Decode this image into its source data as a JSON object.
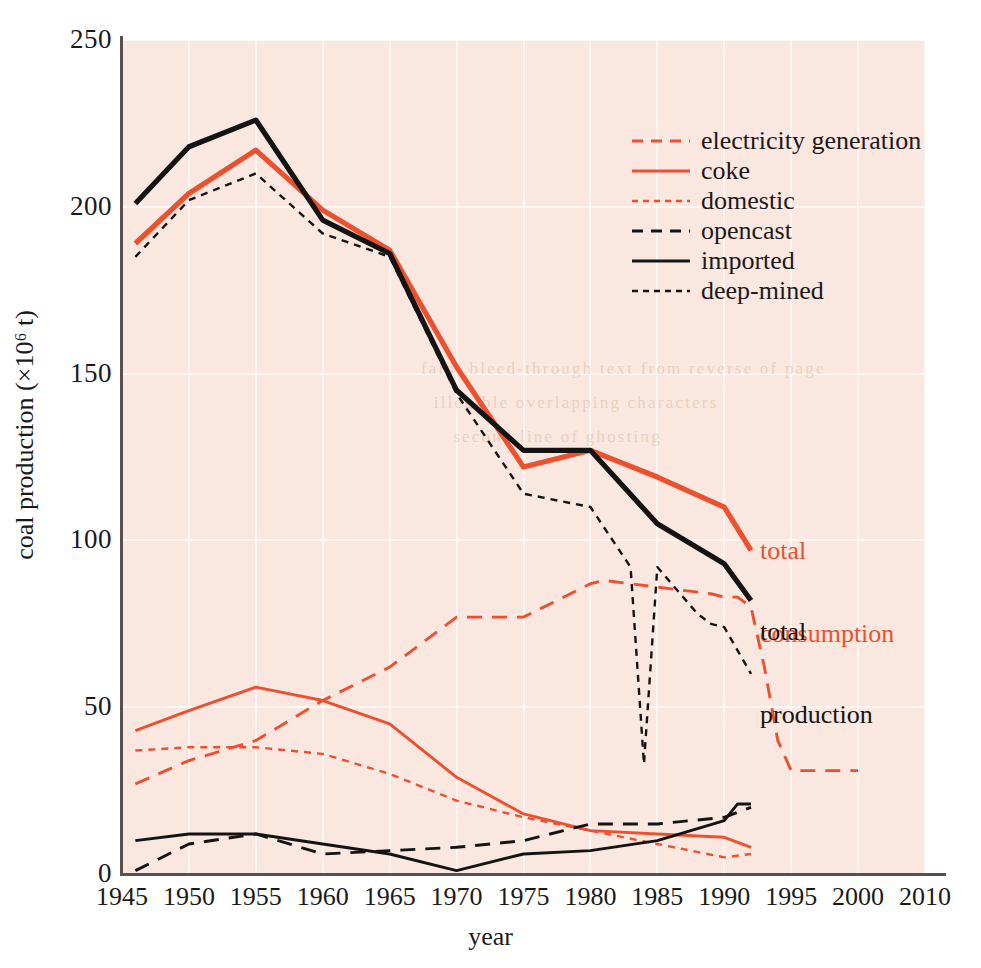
{
  "chart_data": {
    "type": "line",
    "title": "",
    "xlabel": "year",
    "ylabel": "coal production (×10⁶ t)",
    "xlim": [
      1945,
      2010
    ],
    "ylim": [
      0,
      250
    ],
    "xticks": [
      "1945",
      "1950",
      "1955",
      "1960",
      "1965",
      "1970",
      "1975",
      "1980",
      "1985",
      "1990",
      "1995",
      "2000",
      "2010"
    ],
    "yticks": [
      "0",
      "50",
      "100",
      "150",
      "200",
      "250"
    ],
    "grid": true,
    "legend_position": "upper-right",
    "series": [
      {
        "name": "electricity generation",
        "color": "#ec512f",
        "style": "dashed",
        "x": [
          1946,
          1950,
          1955,
          1960,
          1965,
          1970,
          1975,
          1980,
          1981,
          1985,
          1989,
          1990,
          1991,
          1992,
          1993,
          1994,
          1995,
          2000
        ],
        "y": [
          27,
          34,
          40,
          52,
          62,
          77,
          77,
          87,
          88,
          86,
          84,
          83,
          83,
          80,
          62,
          40,
          31,
          31
        ]
      },
      {
        "name": "coke",
        "color": "#ec512f",
        "style": "solid",
        "x": [
          1946,
          1950,
          1955,
          1960,
          1965,
          1970,
          1975,
          1980,
          1985,
          1990,
          1992
        ],
        "y": [
          43,
          49,
          56,
          52,
          45,
          29,
          18,
          13,
          12,
          11,
          8
        ]
      },
      {
        "name": "domestic",
        "color": "#ec512f",
        "style": "dotted",
        "x": [
          1946,
          1950,
          1955,
          1960,
          1965,
          1970,
          1975,
          1980,
          1985,
          1990,
          1992
        ],
        "y": [
          37,
          38,
          38,
          36,
          30,
          22,
          17,
          13,
          9,
          5,
          6
        ]
      },
      {
        "name": "opencast",
        "color": "#141414",
        "style": "dashed",
        "x": [
          1946,
          1950,
          1955,
          1960,
          1965,
          1970,
          1975,
          1980,
          1985,
          1990,
          1992
        ],
        "y": [
          1,
          9,
          12,
          6,
          7,
          8,
          10,
          15,
          15,
          17,
          20
        ]
      },
      {
        "name": "imported",
        "color": "#141414",
        "style": "solid",
        "x": [
          1946,
          1950,
          1955,
          1960,
          1965,
          1970,
          1975,
          1980,
          1985,
          1990,
          1991,
          1992
        ],
        "y": [
          10,
          12,
          12,
          9,
          6,
          1,
          6,
          7,
          10,
          16,
          21,
          21
        ]
      },
      {
        "name": "deep-mined",
        "color": "#141414",
        "style": "dotted",
        "x": [
          1946,
          1950,
          1955,
          1960,
          1965,
          1970,
          1975,
          1980,
          1983,
          1984,
          1985,
          1988,
          1989,
          1990,
          1992
        ],
        "y": [
          185,
          202,
          210,
          192,
          185,
          144,
          114,
          110,
          92,
          33,
          92,
          78,
          75,
          74,
          60
        ]
      },
      {
        "name": "total consumption",
        "color": "#ec512f",
        "style": "solid-thick",
        "x": [
          1946,
          1950,
          1955,
          1960,
          1965,
          1970,
          1975,
          1980,
          1985,
          1990,
          1992
        ],
        "y": [
          189,
          204,
          217,
          199,
          187,
          152,
          122,
          127,
          119,
          110,
          97
        ]
      },
      {
        "name": "total production",
        "color": "#141414",
        "style": "solid-thick",
        "x": [
          1946,
          1950,
          1955,
          1960,
          1965,
          1970,
          1975,
          1980,
          1985,
          1990,
          1992
        ],
        "y": [
          201,
          218,
          226,
          196,
          186,
          145,
          127,
          127,
          105,
          93,
          82
        ]
      }
    ],
    "annotations": [
      {
        "name": "total-consumption",
        "text": "total\nconsumption",
        "color": "#ec512f"
      },
      {
        "name": "total-production",
        "text": "total\nproduction",
        "color": "#141414"
      }
    ],
    "ghost_text": "  faint bleed-through text from reverse of page\n    illegible overlapping characters\n       second line of ghosting"
  },
  "legend": {
    "items": [
      {
        "label": "electricity generation",
        "color": "#ec512f",
        "style": "dashed"
      },
      {
        "label": "coke",
        "color": "#ec512f",
        "style": "solid"
      },
      {
        "label": "domestic",
        "color": "#ec512f",
        "style": "dotted"
      },
      {
        "label": "opencast",
        "color": "#141414",
        "style": "dashed"
      },
      {
        "label": "imported",
        "color": "#141414",
        "style": "solid"
      },
      {
        "label": "deep-mined",
        "color": "#141414",
        "style": "dotted"
      }
    ]
  },
  "axes": {
    "x_label": "year",
    "y_label": "coal production (×10⁶ t)"
  },
  "annotations": {
    "total_consumption_line1": "total",
    "total_consumption_line2": "consumption",
    "total_production_line1": "total",
    "total_production_line2": "production"
  },
  "colors": {
    "accent_red": "#ec512f",
    "ink_black": "#141414",
    "plot_background": "#fae7e0",
    "page_background": "#ffffff",
    "axis": "#59504e"
  }
}
